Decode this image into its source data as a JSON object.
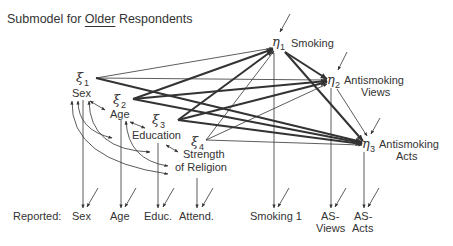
{
  "title": {
    "prefix": "Submodel for ",
    "underlined": "Older",
    "suffix": " Respondents"
  },
  "exogenous": [
    {
      "symbol": "ξ",
      "index": "1",
      "label": "Sex"
    },
    {
      "symbol": "ξ",
      "index": "2",
      "label": "Age"
    },
    {
      "symbol": "ξ",
      "index": "3",
      "label": "Education"
    },
    {
      "symbol": "ξ",
      "index": "4",
      "label_line1": "Strength",
      "label_line2": "of Religion"
    }
  ],
  "endogenous": [
    {
      "symbol": "η",
      "index": "1",
      "label": "Smoking"
    },
    {
      "symbol": "η",
      "index": "2",
      "label_line1": "Antismoking",
      "label_line2": "Views"
    },
    {
      "symbol": "η",
      "index": "3",
      "label_line1": "Antismoking",
      "label_line2": "Acts"
    }
  ],
  "reported": {
    "prefix": "Reported:",
    "items": [
      {
        "label": "Sex"
      },
      {
        "label": "Age"
      },
      {
        "label": "Educ."
      },
      {
        "label": "Attend."
      },
      {
        "label": "Smoking 1"
      },
      {
        "label_line1": "AS-",
        "label_line2": "Views"
      },
      {
        "label_line1": "AS-",
        "label_line2": "Acts"
      }
    ]
  },
  "colors": {
    "ink": "#333333",
    "background": "#ffffff"
  }
}
